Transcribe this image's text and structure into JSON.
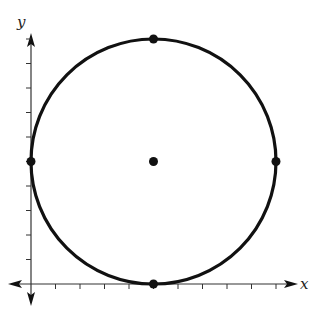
{
  "chart_data": {
    "type": "scatter",
    "title": "",
    "xlabel": "x",
    "ylabel": "y",
    "grid": false,
    "xlim": [
      -0.5,
      11
    ],
    "ylim": [
      -0.5,
      10.5
    ],
    "x_ticks": [
      1,
      2,
      3,
      4,
      5,
      6,
      7,
      8,
      9,
      10
    ],
    "y_ticks": [
      1,
      2,
      3,
      4,
      5,
      6,
      7,
      8,
      9,
      10
    ],
    "shapes": [
      {
        "type": "circle",
        "center": [
          5,
          5
        ],
        "radius": 5
      }
    ],
    "points": [
      {
        "label": "center",
        "x": 5,
        "y": 5
      },
      {
        "label": "top",
        "x": 5,
        "y": 10
      },
      {
        "label": "bottom",
        "x": 5,
        "y": 0
      },
      {
        "label": "left",
        "x": 0,
        "y": 5
      },
      {
        "label": "right",
        "x": 10,
        "y": 5
      }
    ]
  },
  "labels": {
    "x": "x",
    "y": "y"
  },
  "colors": {
    "ink": "#111111",
    "axis": "#333333"
  }
}
